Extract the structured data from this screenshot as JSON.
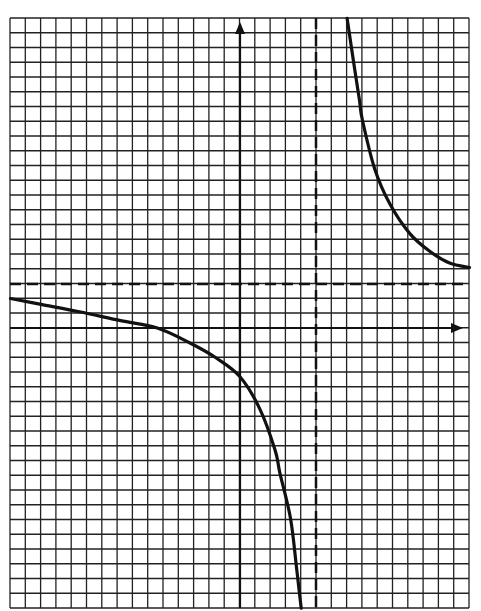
{
  "chart_data": {
    "type": "line",
    "title": "",
    "xlabel": "",
    "ylabel": "",
    "grid": true,
    "grid_cells": {
      "columns": 30,
      "rows": 40
    },
    "xlim": [
      -15,
      15
    ],
    "ylim": [
      -19,
      21
    ],
    "asymptotes": {
      "vertical_x": 5,
      "horizontal_y": 3
    },
    "series": [
      {
        "name": "left-branch",
        "x": [
          -15,
          -13,
          -10.5,
          -7.8,
          -5.4,
          -3.3,
          -1.6,
          0,
          1.3,
          2.3,
          2.6,
          3.3,
          3.7,
          4.0
        ],
        "y": [
          2,
          1.6,
          1.1,
          0.5,
          0,
          -1,
          -2,
          -3.3,
          -5.5,
          -8.3,
          -9.8,
          -12.9,
          -16.3,
          -19
        ]
      },
      {
        "name": "right-branch",
        "x": [
          7.0,
          7.4,
          7.8,
          8.0,
          8.8,
          9.8,
          11.1,
          12.4,
          13.7,
          15.0
        ],
        "y": [
          21,
          18.2,
          15.5,
          14.1,
          10.8,
          8.4,
          6.4,
          5.2,
          4.4,
          4.1
        ]
      }
    ]
  },
  "colors": {
    "grid": "#222222",
    "curve": "#111111",
    "background": "#ffffff"
  },
  "geometry": {
    "left": 10,
    "top": 18,
    "right": 469,
    "bottom": 608,
    "y_axis_px": 240,
    "x_axis_px": 328,
    "v_asymptote_px": 316,
    "h_asymptote_px": 284
  }
}
